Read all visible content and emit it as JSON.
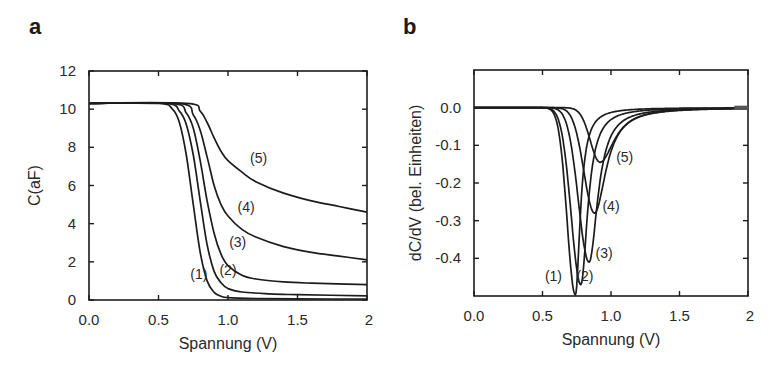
{
  "chart_data": [
    {
      "panel": "a",
      "type": "line",
      "title": "",
      "xlabel": "Spannung (V)",
      "ylabel": "C(aF)",
      "xlim": [
        0,
        2
      ],
      "ylim": [
        0,
        12
      ],
      "xticks": [
        "0.0",
        "0.5",
        "1.0",
        "1.5",
        "2"
      ],
      "xtick_values": [
        0,
        0.5,
        1.0,
        1.5,
        2
      ],
      "yticks": [
        "0",
        "2",
        "4",
        "6",
        "8",
        "10",
        "12"
      ],
      "ytick_values": [
        0,
        2,
        4,
        6,
        8,
        10,
        12
      ],
      "grid": false,
      "legend": "inline curve labels",
      "series": [
        {
          "name": "(1)",
          "label_pos": [
            0.79,
            1.1
          ],
          "x": [
            0.0,
            0.5,
            0.6,
            0.65,
            0.7,
            0.75,
            0.8,
            0.85,
            0.9,
            0.95,
            1.0,
            1.2,
            1.5,
            2.0
          ],
          "y": [
            10.3,
            10.3,
            10.0,
            9.3,
            7.6,
            5.0,
            2.5,
            1.0,
            0.4,
            0.2,
            0.12,
            0.08,
            0.06,
            0.05
          ]
        },
        {
          "name": "(2)",
          "label_pos": [
            1.0,
            1.3
          ],
          "x": [
            0.0,
            0.55,
            0.65,
            0.7,
            0.75,
            0.8,
            0.85,
            0.9,
            0.95,
            1.0,
            1.1,
            1.3,
            1.5,
            2.0
          ],
          "y": [
            10.3,
            10.3,
            9.9,
            9.2,
            7.6,
            5.2,
            2.9,
            1.5,
            0.9,
            0.6,
            0.42,
            0.32,
            0.28,
            0.22
          ]
        },
        {
          "name": "(3)",
          "label_pos": [
            1.07,
            2.8
          ],
          "x": [
            0.0,
            0.6,
            0.7,
            0.75,
            0.8,
            0.85,
            0.9,
            0.95,
            1.0,
            1.1,
            1.2,
            1.4,
            1.6,
            2.0
          ],
          "y": [
            10.3,
            10.3,
            9.8,
            9.0,
            7.3,
            5.2,
            3.5,
            2.4,
            1.8,
            1.3,
            1.1,
            0.95,
            0.88,
            0.8
          ]
        },
        {
          "name": "(4)",
          "label_pos": [
            1.13,
            4.6
          ],
          "x": [
            0.0,
            0.65,
            0.75,
            0.8,
            0.85,
            0.9,
            0.95,
            1.0,
            1.1,
            1.2,
            1.4,
            1.6,
            1.8,
            2.0
          ],
          "y": [
            10.3,
            10.3,
            9.7,
            8.9,
            7.5,
            6.0,
            5.0,
            4.4,
            3.7,
            3.3,
            2.8,
            2.5,
            2.3,
            2.1
          ]
        },
        {
          "name": "(5)",
          "label_pos": [
            1.22,
            7.2
          ],
          "x": [
            0.0,
            0.7,
            0.8,
            0.85,
            0.9,
            0.95,
            1.0,
            1.1,
            1.2,
            1.4,
            1.6,
            1.8,
            2.0
          ],
          "y": [
            10.3,
            10.3,
            9.9,
            9.3,
            8.5,
            7.8,
            7.3,
            6.7,
            6.2,
            5.6,
            5.2,
            4.9,
            4.6
          ]
        }
      ]
    },
    {
      "panel": "b",
      "type": "line",
      "title": "",
      "xlabel": "Spannung (V)",
      "ylabel": "dC/dV (bel. Einheiten)",
      "xlim": [
        0,
        2
      ],
      "ylim": [
        -0.5,
        0.1
      ],
      "xticks": [
        "0.0",
        "0.5",
        "1.0",
        "1.5",
        "2"
      ],
      "xtick_values": [
        0,
        0.5,
        1.0,
        1.5,
        2
      ],
      "yticks": [
        "0.0",
        "-0.1",
        "-0.2",
        "-0.3",
        "-0.4"
      ],
      "ytick_values": [
        0,
        -0.1,
        -0.2,
        -0.3,
        -0.4
      ],
      "grid": false,
      "legend": "inline curve labels",
      "series": [
        {
          "name": "(1)",
          "peak_x": 0.74,
          "peak_y": -0.497,
          "width_left": 0.085,
          "width_right": 0.05,
          "label_pos": [
            0.58,
            -0.46
          ]
        },
        {
          "name": "(2)",
          "peak_x": 0.78,
          "peak_y": -0.47,
          "width_left": 0.1,
          "width_right": 0.07,
          "label_pos": [
            0.81,
            -0.46
          ]
        },
        {
          "name": "(3)",
          "peak_x": 0.84,
          "peak_y": -0.41,
          "width_left": 0.11,
          "width_right": 0.09,
          "label_pos": [
            0.95,
            -0.4
          ]
        },
        {
          "name": "(4)",
          "peak_x": 0.88,
          "peak_y": -0.28,
          "width_left": 0.11,
          "width_right": 0.12,
          "label_pos": [
            1.0,
            -0.275
          ]
        },
        {
          "name": "(5)",
          "peak_x": 0.92,
          "peak_y": -0.145,
          "width_left": 0.1,
          "width_right": 0.15,
          "label_pos": [
            1.1,
            -0.145
          ]
        }
      ]
    }
  ],
  "panels": {
    "a": {
      "letter": "a"
    },
    "b": {
      "letter": "b"
    }
  },
  "colors": {
    "line": "#1c1c1c",
    "frame": "#1c1c1c",
    "text": "#2a2a2a",
    "background": "#ffffff"
  }
}
